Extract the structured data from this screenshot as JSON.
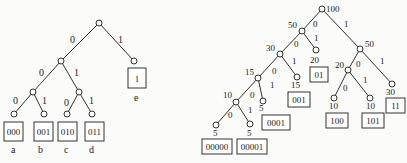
{
  "left_tree": {
    "edge_labels": {
      "root_0": "0",
      "root_1": "1",
      "l1_0": "0",
      "l1_1": "1",
      "l2a_0": "0",
      "l2a_1": "1",
      "l2b_0": "0",
      "l2b_1": "1"
    },
    "leaves": [
      {
        "code": "000",
        "symbol": "a"
      },
      {
        "code": "001",
        "symbol": "b"
      },
      {
        "code": "010",
        "symbol": "c"
      },
      {
        "code": "011",
        "symbol": "d"
      },
      {
        "code": "1",
        "symbol": "e"
      }
    ]
  },
  "right_tree": {
    "weights": {
      "root": "100",
      "n50l": "50",
      "n50r": "50",
      "n30": "30",
      "n20a": "20",
      "n15": "15",
      "n15b": "15",
      "n10": "10",
      "n5a": "5",
      "n5b": "5",
      "n5c": "5",
      "n20b": "20",
      "n10a": "10",
      "n10b": "10",
      "n30b": "30"
    },
    "edge_labels": {
      "e0": "0",
      "e1": "1"
    },
    "leaves": [
      {
        "code": "01"
      },
      {
        "code": "001"
      },
      {
        "code": "0001"
      },
      {
        "code": "00000"
      },
      {
        "code": "00001"
      },
      {
        "code": "100"
      },
      {
        "code": "101"
      },
      {
        "code": "11"
      }
    ]
  }
}
